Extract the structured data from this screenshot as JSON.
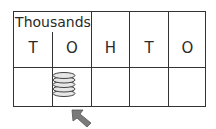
{
  "place_value_chart": {
    "group_header": "Thousands",
    "columns": [
      {
        "label": "T",
        "counters": 0
      },
      {
        "label": "O",
        "counters": 5
      },
      {
        "label": "H",
        "counters": 0
      },
      {
        "label": "T",
        "counters": 0
      },
      {
        "label": "O",
        "counters": 0
      }
    ],
    "pointer": "arrow pointing at thousands-ones counters"
  },
  "colors": {
    "lines": "#333333",
    "counter_fill": "#e6e6e6",
    "arrow_fill": "#7a7a7a"
  }
}
